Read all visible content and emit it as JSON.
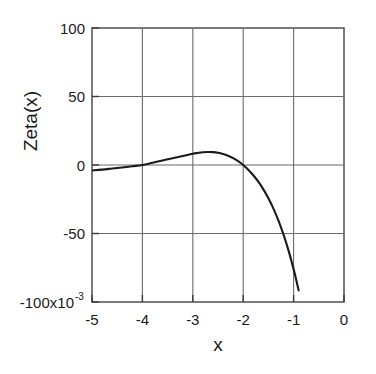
{
  "chart_data": {
    "type": "line",
    "title": "",
    "xlabel": "x",
    "ylabel": "Zeta(x)",
    "xlim": [
      -5,
      0
    ],
    "ylim": [
      -100,
      100
    ],
    "y_scale_factor": "x10",
    "y_scale_exponent": "-3",
    "grid": true,
    "legend": false,
    "xticks": [
      -5,
      -4,
      -3,
      -2,
      -1,
      0
    ],
    "xtick_labels": [
      "-5",
      "-4",
      "-3",
      "-2",
      "-1",
      "0"
    ],
    "yticks": [
      -100,
      -50,
      0,
      50,
      100
    ],
    "ytick_labels": [
      "-100x10",
      "-50",
      "0",
      "50",
      "100"
    ],
    "ytick_label_bottom_base": "-100x10",
    "ytick_label_bottom_exp": "-3",
    "series": [
      {
        "name": "Zeta(x)",
        "color": "#1a1a1a",
        "x": [
          -5.0,
          -4.8,
          -4.6,
          -4.4,
          -4.2,
          -4.0,
          -3.8,
          -3.6,
          -3.4,
          -3.2,
          -3.0,
          -2.9,
          -2.8,
          -2.7,
          -2.6,
          -2.5,
          -2.4,
          -2.3,
          -2.2,
          -2.1,
          -2.0,
          -1.9,
          -1.8,
          -1.7,
          -1.6,
          -1.5,
          -1.4,
          -1.3,
          -1.2,
          -1.1,
          -1.0,
          -0.95,
          -0.9
        ],
        "y": [
          -4.0,
          -3.4,
          -2.6,
          -1.8,
          -0.9,
          0.0,
          1.6,
          3.3,
          5.0,
          6.6,
          8.2,
          8.8,
          9.3,
          9.5,
          9.4,
          8.9,
          8.0,
          6.7,
          5.0,
          2.8,
          0.0,
          -3.4,
          -7.5,
          -12.2,
          -17.8,
          -24.3,
          -31.8,
          -40.6,
          -50.8,
          -62.5,
          -76.0,
          -83.5,
          -91.5
        ]
      }
    ]
  }
}
